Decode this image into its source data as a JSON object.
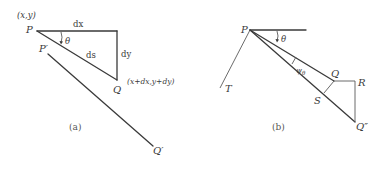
{
  "figure": {
    "panels": [
      {
        "id": "a",
        "caption": "(a)",
        "labels": {
          "point_p_coords": "(x,y)",
          "point_p": "P",
          "dx": "dx",
          "dy": "dy",
          "ds": "ds",
          "theta": "θ",
          "point_q": "Q",
          "point_q_coords": "(x+dx,y+dy)",
          "point_p_prime": "P′",
          "point_q_prime": "Q′"
        }
      },
      {
        "id": "b",
        "caption": "(b)",
        "labels": {
          "point_p": "P",
          "theta": "θ",
          "psi": "ψ",
          "psi_sub": "θ",
          "point_t": "T",
          "point_q": "Q",
          "point_r": "R",
          "point_s": "S",
          "point_q_double_prime": "Q″"
        }
      }
    ]
  },
  "colors": {
    "line": "#3a3a3a",
    "text": "#3a3a3a",
    "background": "#ffffff"
  }
}
